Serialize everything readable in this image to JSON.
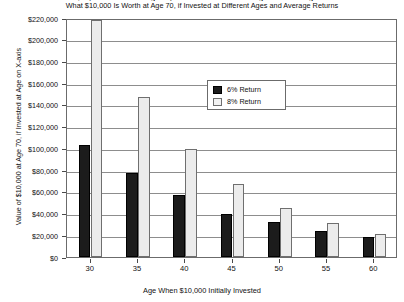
{
  "chart_data": {
    "type": "bar",
    "title": "What $10,000 Is Worth at Age 70, if Invested at Different Ages and Average Returns",
    "title_top_clipped": "What $10,000 Is Worth at Age 70, if Invested at Different Ages and Average Returns",
    "xlabel": "Age When $10,000 Initially Invested",
    "ylabel": "Value of $10,000 at Age 70, if Invested at Age on X-axis",
    "categories": [
      "30",
      "35",
      "40",
      "45",
      "50",
      "55",
      "60"
    ],
    "series": [
      {
        "name": "6% Return",
        "color": "#1c1c1c",
        "values": [
          103000,
          77000,
          57000,
          40000,
          32000,
          24000,
          18000
        ]
      },
      {
        "name": "8% Return",
        "color": "#ececec",
        "values": [
          218000,
          147000,
          99000,
          67000,
          45000,
          31000,
          21000
        ]
      }
    ],
    "ylim": [
      0,
      220000
    ],
    "ytick_values": [
      220000,
      200000,
      180000,
      160000,
      140000,
      120000,
      100000,
      80000,
      60000,
      40000,
      20000,
      0
    ],
    "ytick_labels": [
      "$220,000",
      "$200,000",
      "$180,000",
      "$160,000",
      "$140,000",
      "$120,000",
      "$100,000",
      "$80,000",
      "$60,000",
      "$40,000",
      "$20,000",
      "$0"
    ],
    "grid": true,
    "grid_axis": "y",
    "legend_position": "upper-center"
  },
  "legend": {
    "entries": [
      {
        "label": "6% Return"
      },
      {
        "label": "8% Return"
      }
    ]
  }
}
